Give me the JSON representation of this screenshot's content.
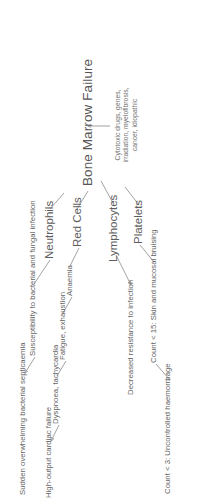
{
  "figure": {
    "type": "flow-diagram",
    "title": "Bone Marrow Failure",
    "orientation": "rotated-90-ccw",
    "background_color": "#ffffff",
    "text_color": "#5b5b5b",
    "line_color": "#8a8a8a"
  },
  "central_node": {
    "label": "Bone Marrow Failure"
  },
  "cause_node": {
    "label": "Cytotoxic drugs, genes, irradiation, myelofibrosis, cancer, idiopathic"
  },
  "cell_lines": [
    {
      "id": "red-cells",
      "label": "Red Cells"
    },
    {
      "id": "neutrophils",
      "label": "Neutrophils"
    },
    {
      "id": "platelets",
      "label": "Platelets"
    },
    {
      "id": "lymphocytes",
      "label": "Lymphocytes"
    }
  ],
  "consequences": {
    "red_cells": [
      {
        "id": "anaemia",
        "label": "Anaemia"
      },
      {
        "id": "fatigue",
        "label": "Fatigue, exhaustion"
      },
      {
        "id": "dyspnoea",
        "label": "Dyspnoea, tachycardia"
      },
      {
        "id": "cardiac-failure",
        "label": "High-output cardiac failure"
      }
    ],
    "neutrophils": [
      {
        "id": "susceptibility",
        "label": "Susceptibility to bacterial and fungal infection"
      },
      {
        "id": "septicaemia",
        "label": "Sudden overwhelming bacterial septicaemia"
      }
    ],
    "platelets": [
      {
        "id": "count-15",
        "label": "Count < 15: Skin and mucosal bruising"
      },
      {
        "id": "count-3",
        "label": "Count < 3: Uncontrolled haemorrhage"
      }
    ],
    "lymphocytes": [
      {
        "id": "decreased-resistance",
        "label": "Decreased resistance to infection"
      }
    ]
  }
}
